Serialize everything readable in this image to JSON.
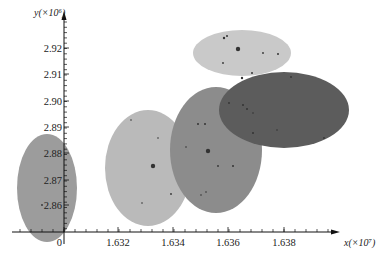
{
  "chart_data": {
    "type": "scatter",
    "title": "",
    "xlabel": "x(×10⁷)",
    "ylabel": "y(×10⁶)",
    "x_axis": {
      "ticks": [
        {
          "label": "0",
          "px": 64
        },
        {
          "label": "1.632",
          "px": 118
        },
        {
          "label": "1.634",
          "px": 173
        },
        {
          "label": "1.636",
          "px": 228
        },
        {
          "label": "1.638",
          "px": 284
        }
      ],
      "range": [
        1.6305,
        1.64
      ],
      "broken_axis": true
    },
    "y_axis": {
      "ticks": [
        {
          "label": "2.92",
          "py": 48
        },
        {
          "label": "2.91",
          "py": 74
        },
        {
          "label": "2.90",
          "py": 101
        },
        {
          "label": "2.89",
          "py": 127
        },
        {
          "label": "2.88",
          "py": 153
        },
        {
          "label": "2.87",
          "py": 180
        },
        {
          "label": "2.86",
          "py": 205
        }
      ],
      "range": [
        2.85,
        2.93
      ],
      "broken_axis": true
    },
    "grid": false,
    "legend": null,
    "series": [
      {
        "name": "cluster-left",
        "shape": "ellipse",
        "cx": 47,
        "cy": 188,
        "rx": 30,
        "ry": 54,
        "color": "#9c9c9c",
        "center_value": {
          "x": "<1.630",
          "y": 2.867
        }
      },
      {
        "name": "cluster-light",
        "shape": "ellipse",
        "cx": 148,
        "cy": 168,
        "rx": 43,
        "ry": 58,
        "color": "#bababa",
        "center_value": {
          "x": 1.6331,
          "y": 2.875
        }
      },
      {
        "name": "cluster-mid",
        "shape": "ellipse",
        "cx": 216,
        "cy": 150,
        "rx": 46,
        "ry": 63,
        "color": "#8c8c8c",
        "center_value": {
          "x": 1.6356,
          "y": 2.881
        }
      },
      {
        "name": "cluster-dark",
        "shape": "ellipse",
        "cx": 284,
        "cy": 110,
        "rx": 65,
        "ry": 38,
        "color": "#5c5c5c",
        "center_value": {
          "x": 1.638,
          "y": 2.897
        }
      },
      {
        "name": "cluster-top",
        "shape": "ellipse",
        "cx": 242,
        "cy": 53,
        "rx": 49,
        "ry": 23,
        "color": "#c9c9c9",
        "center_value": {
          "x": 1.6365,
          "y": 2.918
        }
      }
    ],
    "points": [
      {
        "cx": 238,
        "cy": 49,
        "r": 2.2
      },
      {
        "cx": 224,
        "cy": 38,
        "r": 1.2
      },
      {
        "cx": 227,
        "cy": 36,
        "r": 1.0
      },
      {
        "cx": 263,
        "cy": 53,
        "r": 0.9
      },
      {
        "cx": 278,
        "cy": 54,
        "r": 1.0
      },
      {
        "cx": 223,
        "cy": 63,
        "r": 0.9
      },
      {
        "cx": 252,
        "cy": 73,
        "r": 1.0
      },
      {
        "cx": 153,
        "cy": 166,
        "r": 2.2
      },
      {
        "cx": 171,
        "cy": 194,
        "r": 0.9
      },
      {
        "cx": 158,
        "cy": 138,
        "r": 0.8
      },
      {
        "cx": 142,
        "cy": 203,
        "r": 0.8
      },
      {
        "cx": 131,
        "cy": 120,
        "r": 0.8
      },
      {
        "cx": 208,
        "cy": 151,
        "r": 2.2
      },
      {
        "cx": 198,
        "cy": 124,
        "r": 1.0
      },
      {
        "cx": 205,
        "cy": 124,
        "r": 1.0
      },
      {
        "cx": 218,
        "cy": 166,
        "r": 0.9
      },
      {
        "cx": 233,
        "cy": 166,
        "r": 1.0
      },
      {
        "cx": 206,
        "cy": 192,
        "r": 0.8
      },
      {
        "cx": 186,
        "cy": 147,
        "r": 0.8
      },
      {
        "cx": 201,
        "cy": 195,
        "r": 0.8
      },
      {
        "cx": 242,
        "cy": 78,
        "r": 1.2
      },
      {
        "cx": 243,
        "cy": 105,
        "r": 1.0
      },
      {
        "cx": 247,
        "cy": 109,
        "r": 1.0
      },
      {
        "cx": 229,
        "cy": 103,
        "r": 0.9
      },
      {
        "cx": 253,
        "cy": 133,
        "r": 1.0
      },
      {
        "cx": 291,
        "cy": 77,
        "r": 0.9
      },
      {
        "cx": 324,
        "cy": 138,
        "r": 0.9
      },
      {
        "cx": 277,
        "cy": 130,
        "r": 0.8
      },
      {
        "cx": 253,
        "cy": 113,
        "r": 0.8
      },
      {
        "cx": 42,
        "cy": 205,
        "r": 0.9
      }
    ]
  }
}
